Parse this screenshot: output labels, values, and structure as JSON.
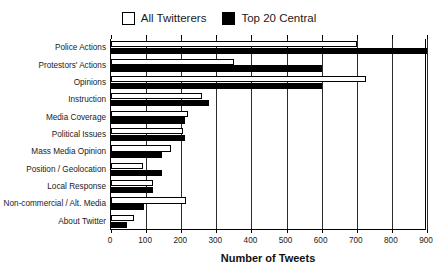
{
  "legend": {
    "position": "top-center",
    "entries": [
      {
        "label": "All Twitterers",
        "style": "hollow",
        "color": "#ffffff"
      },
      {
        "label": "Top 20 Central",
        "style": "filled",
        "color": "#000000"
      }
    ]
  },
  "axis": {
    "x_title": "Number of Tweets",
    "ticks": [
      "0",
      "100",
      "200",
      "300",
      "400",
      "500",
      "600",
      "700",
      "800",
      "900"
    ]
  },
  "chart_data": {
    "type": "bar",
    "orientation": "horizontal",
    "title": "",
    "xlabel": "Number of Tweets",
    "ylabel": "",
    "xlim": [
      0,
      900
    ],
    "xticks": [
      0,
      100,
      200,
      300,
      400,
      500,
      600,
      700,
      800,
      900
    ],
    "grid": true,
    "legend_position": "top-center",
    "categories": [
      "Police Actions",
      "Protestors' Actions",
      "Opinions",
      "Instruction",
      "Media Coverage",
      "Political Issues",
      "Mass Media Opinion",
      "Position / Geolocation",
      "Local Response",
      "Non-commercial / Alt. Media",
      "About Twitter"
    ],
    "series": [
      {
        "name": "All Twitterers",
        "color": "#ffffff",
        "values": [
          700,
          350,
          725,
          260,
          220,
          205,
          170,
          90,
          120,
          215,
          65
        ]
      },
      {
        "name": "Top 20 Central",
        "color": "#000000",
        "values": [
          900,
          600,
          600,
          280,
          210,
          210,
          145,
          145,
          120,
          95,
          45
        ]
      }
    ]
  }
}
